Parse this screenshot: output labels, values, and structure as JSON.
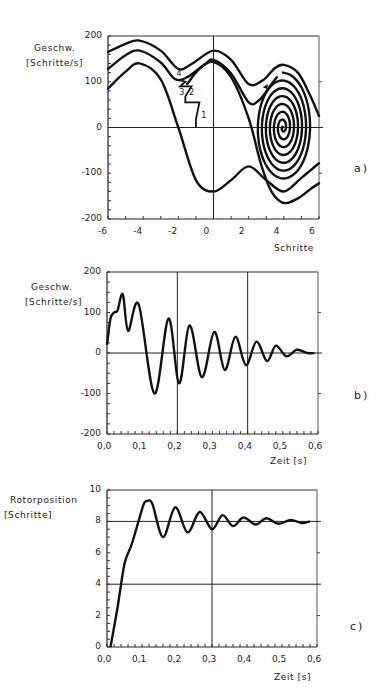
{
  "chart_data": [
    {
      "id": "a",
      "type": "line",
      "panel_label": "a)",
      "title": "",
      "xlabel": "Schritte",
      "ylabel": "Geschw. [Schritte/s]",
      "ylabel_line1": "Geschw.",
      "ylabel_line2": "[Schritte/s]",
      "xlim": [
        -6,
        6
      ],
      "ylim": [
        -200,
        200
      ],
      "xticks": [
        "-6",
        "-4",
        "-2",
        "0",
        "2",
        "4",
        "6"
      ],
      "yticks": [
        "200",
        "100",
        "0",
        "-100",
        "-200"
      ],
      "annotations": [
        "1",
        "2",
        "3",
        "4"
      ],
      "series": [
        {
          "name": "trajectory upper",
          "x": [
            -6,
            -5,
            -4,
            -3,
            -2,
            -1,
            0,
            1,
            2,
            3,
            4,
            5,
            6
          ],
          "values": [
            165,
            185,
            190,
            165,
            128,
            138,
            170,
            145,
            95,
            110,
            140,
            95,
            25
          ]
        },
        {
          "name": "trajectory middle",
          "x": [
            -6,
            -5,
            -4,
            -3,
            -2,
            -1,
            0,
            1,
            2,
            3,
            4,
            5,
            6
          ],
          "values": [
            130,
            160,
            168,
            140,
            100,
            115,
            150,
            110,
            55,
            80,
            0,
            0,
            0
          ]
        },
        {
          "name": "trajectory lower",
          "x": [
            -6,
            -5,
            -4,
            -3,
            -2,
            -1,
            0,
            1,
            2,
            3,
            4,
            5,
            6
          ],
          "values": [
            85,
            125,
            140,
            105,
            0,
            -110,
            -140,
            -110,
            -85,
            -120,
            -135,
            -110,
            -80
          ]
        },
        {
          "name": "trajectory bottom",
          "x": [
            2,
            3,
            4,
            5,
            6
          ],
          "values": [
            -20,
            -110,
            -165,
            -150,
            -120
          ]
        }
      ]
    },
    {
      "id": "b",
      "type": "line",
      "panel_label": "b)",
      "title": "",
      "xlabel": "Zeit [s]",
      "ylabel": "Geschw. [Schritte/s]",
      "ylabel_line1": "Geschw.",
      "ylabel_line2": "[Schritte/s]",
      "xlim": [
        0,
        0.6
      ],
      "ylim": [
        -200,
        200
      ],
      "xticks": [
        "0,0",
        "0,1",
        "0,2",
        "0,3",
        "0,4",
        "0,5",
        "0,6"
      ],
      "yticks": [
        "200",
        "100",
        "0",
        "-100",
        "-200"
      ],
      "x": [
        0.0,
        0.01,
        0.02,
        0.03,
        0.045,
        0.06,
        0.09,
        0.135,
        0.175,
        0.205,
        0.235,
        0.27,
        0.305,
        0.335,
        0.365,
        0.395,
        0.425,
        0.455,
        0.48,
        0.51,
        0.54,
        0.57,
        0.59
      ],
      "values": [
        20,
        85,
        100,
        105,
        145,
        55,
        120,
        -100,
        85,
        -75,
        68,
        -60,
        52,
        -42,
        40,
        -30,
        28,
        -20,
        18,
        -8,
        8,
        0,
        0
      ]
    },
    {
      "id": "c",
      "type": "line",
      "panel_label": "c)",
      "title": "",
      "xlabel": "Zeit [s]",
      "ylabel": "Rotorposition [Schritte]",
      "ylabel_line1": "Rotorposition",
      "ylabel_line2": "[Schritte]",
      "xlim": [
        0,
        0.6
      ],
      "ylim": [
        0,
        10
      ],
      "xticks": [
        "0,0",
        "0,1",
        "0,2",
        "0,3",
        "0,4",
        "0,5",
        "0,6"
      ],
      "yticks": [
        "10",
        "8",
        "6",
        "4",
        "2",
        "0"
      ],
      "x": [
        0.01,
        0.03,
        0.05,
        0.07,
        0.09,
        0.105,
        0.115,
        0.13,
        0.16,
        0.195,
        0.23,
        0.265,
        0.3,
        0.33,
        0.36,
        0.39,
        0.425,
        0.455,
        0.49,
        0.525,
        0.555,
        0.58
      ],
      "values": [
        0,
        2.5,
        5.3,
        6.5,
        8.0,
        9.1,
        9.3,
        9.1,
        7.0,
        8.9,
        7.3,
        8.6,
        7.5,
        8.4,
        7.7,
        8.25,
        7.8,
        8.2,
        7.85,
        8.1,
        7.9,
        8.0
      ]
    }
  ]
}
